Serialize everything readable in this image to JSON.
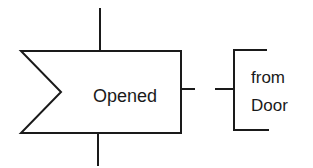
{
  "diagram": {
    "type": "SDL input signal with comment",
    "input_symbol": {
      "label": "Opened"
    },
    "comment": {
      "lines": [
        "from",
        "Door"
      ]
    },
    "colors": {
      "stroke": "#1a1a1a",
      "background": "#ffffff"
    }
  }
}
